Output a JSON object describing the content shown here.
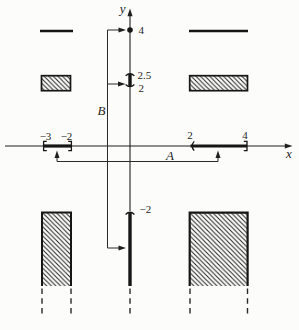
{
  "figure": {
    "description_colors": {
      "ink": "#1f1f1f",
      "background": "#fcfcfa"
    },
    "axis": {
      "x_label": "x",
      "y_label": "y"
    },
    "callouts": {
      "a_label": "A",
      "b_label": "B"
    },
    "x_ticks": {
      "neg3": "−3",
      "neg2": "−2",
      "pos2": "2",
      "pos4": "4"
    },
    "y_ticks": {
      "pos4": "4",
      "pos2_5": "2.5",
      "pos2": "2",
      "neg2": "−2"
    }
  }
}
